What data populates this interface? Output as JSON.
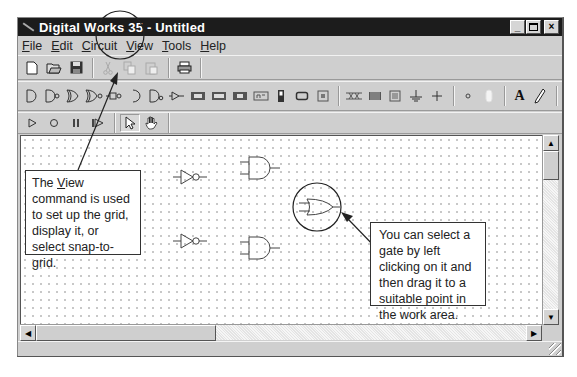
{
  "window": {
    "title": "Digital Works 35 - Untitled",
    "controls": {
      "minimize": "_",
      "maximize": "□",
      "close": "×"
    }
  },
  "menubar": {
    "items": [
      {
        "label": "File",
        "accel": "F"
      },
      {
        "label": "Edit",
        "accel": "E"
      },
      {
        "label": "Circuit",
        "accel": "C"
      },
      {
        "label": "View",
        "accel": "V"
      },
      {
        "label": "Tools",
        "accel": "T"
      },
      {
        "label": "Help",
        "accel": "H"
      }
    ]
  },
  "toolbar_file": {
    "buttons": [
      {
        "name": "new-icon",
        "glyph": "🗋",
        "enabled": true
      },
      {
        "name": "open-icon",
        "glyph": "📂",
        "enabled": true
      },
      {
        "name": "save-icon",
        "glyph": "💾",
        "enabled": true
      },
      {
        "name": "cut-icon",
        "glyph": "✂",
        "enabled": false
      },
      {
        "name": "copy-icon",
        "glyph": "⧉",
        "enabled": false
      },
      {
        "name": "paste-icon",
        "glyph": "📋",
        "enabled": false
      },
      {
        "name": "print-icon",
        "glyph": "🖶",
        "enabled": true
      }
    ]
  },
  "toolbar_gates": {
    "buttons": [
      "and-gate",
      "nand-gate",
      "or-gate",
      "nor-gate",
      "xor-gate",
      "xnor-gate",
      "buffer-gate",
      "not-gate",
      "d-flipflop",
      "jk-flipflop",
      "sr-flipflop",
      "latch",
      "switch",
      "push-button",
      "led",
      "seven-segment",
      "bus",
      "ground",
      "power",
      "wire-node",
      "terminal",
      "text-tool",
      "pencil-tool"
    ]
  },
  "toolbar_mode": {
    "buttons": [
      "play",
      "stop",
      "pause",
      "step",
      "select-pointer",
      "hand-tool"
    ]
  },
  "canvas": {
    "grid": "dotted",
    "gates": [
      {
        "type": "not",
        "x": 175,
        "y": 177
      },
      {
        "type": "and",
        "x": 237,
        "y": 158
      },
      {
        "type": "or",
        "x": 300,
        "y": 195,
        "highlighted": true
      },
      {
        "type": "not",
        "x": 175,
        "y": 240
      },
      {
        "type": "and",
        "x": 237,
        "y": 237
      }
    ]
  },
  "callouts": {
    "view": {
      "line1_prefix": "The ",
      "line1_keyword": "V",
      "line1_keyword_rest": "iew",
      "text": "command is used to set up the grid, display it, or select snap-to-grid."
    },
    "gate": {
      "text": "You can select a gate by left clicking on it and then drag it to a suitable point in the work area."
    }
  },
  "scrollbars": {
    "vertical": {
      "up": "▲",
      "down": "▼"
    },
    "horizontal": {
      "left": "◀",
      "right": "▶"
    }
  },
  "colors": {
    "titlebar": "#1c1c1c",
    "chrome": "#cfcfcf",
    "canvas": "#ffffff"
  }
}
